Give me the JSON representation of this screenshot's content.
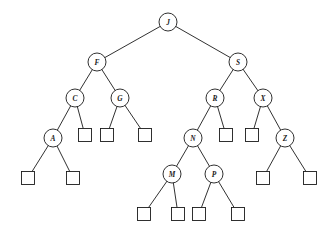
{
  "figure": {
    "background_color": "#ffffff",
    "stroke_color": "#1a1a1a",
    "node_fill_color": "#ffffff",
    "width": 334,
    "height": 234
  },
  "chart_data": {
    "type": "diagram",
    "diagram_type": "binary-search-tree",
    "title": "",
    "node_shape_internal": "circle",
    "node_shape_leaf": "square",
    "internal_node_radius": 9,
    "leaf_node_size": 13,
    "levels": 6,
    "internal_node_count": 12,
    "leaf_node_count": 13,
    "keys_inorder": [
      "A",
      "C",
      "F",
      "G",
      "J",
      "M",
      "N",
      "P",
      "R",
      "S",
      "X",
      "Z"
    ],
    "root": "J",
    "nodes": [
      {
        "id": "J",
        "label": "J",
        "x": 168,
        "y": 22,
        "depth": 0,
        "type": "internal"
      },
      {
        "id": "F",
        "label": "F",
        "x": 97,
        "y": 62,
        "depth": 1,
        "type": "internal"
      },
      {
        "id": "S",
        "label": "S",
        "x": 238,
        "y": 62,
        "depth": 1,
        "type": "internal"
      },
      {
        "id": "C",
        "label": "C",
        "x": 75,
        "y": 98,
        "depth": 2,
        "type": "internal"
      },
      {
        "id": "G",
        "label": "G",
        "x": 120,
        "y": 98,
        "depth": 2,
        "type": "internal"
      },
      {
        "id": "R",
        "label": "R",
        "x": 215,
        "y": 98,
        "depth": 2,
        "type": "internal"
      },
      {
        "id": "X",
        "label": "X",
        "x": 263,
        "y": 98,
        "depth": 2,
        "type": "internal"
      },
      {
        "id": "A",
        "label": "A",
        "x": 53,
        "y": 138,
        "depth": 3,
        "type": "internal"
      },
      {
        "id": "N",
        "label": "N",
        "x": 193,
        "y": 138,
        "depth": 3,
        "type": "internal"
      },
      {
        "id": "Z",
        "label": "Z",
        "x": 285,
        "y": 138,
        "depth": 3,
        "type": "internal"
      },
      {
        "id": "M",
        "label": "M",
        "x": 172,
        "y": 174,
        "depth": 4,
        "type": "internal"
      },
      {
        "id": "P",
        "label": "P",
        "x": 214,
        "y": 174,
        "depth": 4,
        "type": "internal"
      }
    ],
    "leaves": [
      {
        "id": "nil-A-left",
        "x": 28,
        "y": 178,
        "parent": "A",
        "side": "left"
      },
      {
        "id": "nil-A-right",
        "x": 73,
        "y": 178,
        "parent": "A",
        "side": "right"
      },
      {
        "id": "nil-C-right",
        "x": 85,
        "y": 135,
        "parent": "C",
        "side": "right"
      },
      {
        "id": "nil-G-left",
        "x": 107,
        "y": 135,
        "parent": "G",
        "side": "left"
      },
      {
        "id": "nil-G-right",
        "x": 145,
        "y": 135,
        "parent": "G",
        "side": "right"
      },
      {
        "id": "nil-M-left",
        "x": 144,
        "y": 214,
        "parent": "M",
        "side": "left"
      },
      {
        "id": "nil-M-right",
        "x": 178,
        "y": 214,
        "parent": "M",
        "side": "right"
      },
      {
        "id": "nil-P-left",
        "x": 199,
        "y": 214,
        "parent": "P",
        "side": "left"
      },
      {
        "id": "nil-P-right",
        "x": 238,
        "y": 214,
        "parent": "P",
        "side": "right"
      },
      {
        "id": "nil-R-right",
        "x": 226,
        "y": 135,
        "parent": "R",
        "side": "right"
      },
      {
        "id": "nil-X-left",
        "x": 252,
        "y": 135,
        "parent": "X",
        "side": "left"
      },
      {
        "id": "nil-Z-left",
        "x": 263,
        "y": 178,
        "parent": "Z",
        "side": "left"
      },
      {
        "id": "nil-Z-right",
        "x": 310,
        "y": 178,
        "parent": "Z",
        "side": "right"
      }
    ],
    "edges": [
      {
        "from": "J",
        "to": "F",
        "side": "left"
      },
      {
        "from": "J",
        "to": "S",
        "side": "right"
      },
      {
        "from": "F",
        "to": "C",
        "side": "left"
      },
      {
        "from": "F",
        "to": "G",
        "side": "right"
      },
      {
        "from": "S",
        "to": "R",
        "side": "left"
      },
      {
        "from": "S",
        "to": "X",
        "side": "right"
      },
      {
        "from": "C",
        "to": "A",
        "side": "left"
      },
      {
        "from": "C",
        "to": "nil-C-right",
        "side": "right"
      },
      {
        "from": "G",
        "to": "nil-G-left",
        "side": "left"
      },
      {
        "from": "G",
        "to": "nil-G-right",
        "side": "right"
      },
      {
        "from": "R",
        "to": "N",
        "side": "left"
      },
      {
        "from": "R",
        "to": "nil-R-right",
        "side": "right"
      },
      {
        "from": "X",
        "to": "nil-X-left",
        "side": "left"
      },
      {
        "from": "X",
        "to": "Z",
        "side": "right"
      },
      {
        "from": "A",
        "to": "nil-A-left",
        "side": "left"
      },
      {
        "from": "A",
        "to": "nil-A-right",
        "side": "right"
      },
      {
        "from": "N",
        "to": "M",
        "side": "left"
      },
      {
        "from": "N",
        "to": "P",
        "side": "right"
      },
      {
        "from": "Z",
        "to": "nil-Z-left",
        "side": "left"
      },
      {
        "from": "Z",
        "to": "nil-Z-right",
        "side": "right"
      },
      {
        "from": "M",
        "to": "nil-M-left",
        "side": "left"
      },
      {
        "from": "M",
        "to": "nil-M-right",
        "side": "right"
      },
      {
        "from": "P",
        "to": "nil-P-left",
        "side": "left"
      },
      {
        "from": "P",
        "to": "nil-P-right",
        "side": "right"
      }
    ]
  }
}
